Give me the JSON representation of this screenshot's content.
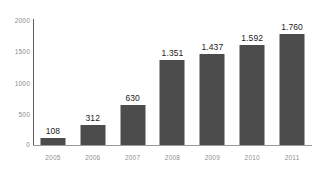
{
  "chart_data": {
    "type": "bar",
    "title": "",
    "subtitle": "",
    "xlabel": "",
    "ylabel": "",
    "categories": [
      "2005",
      "2006",
      "2007",
      "2008",
      "2009",
      "2010",
      "2011"
    ],
    "values": [
      108,
      312,
      630,
      1351,
      1437,
      1592,
      1760
    ],
    "value_labels": [
      "108",
      "312",
      "630",
      "1.351",
      "1.437",
      "1.592",
      "1.760"
    ],
    "ylim": [
      0,
      2000
    ],
    "y_ticks": [
      0,
      500,
      1000,
      1500,
      2000
    ],
    "y_tick_labels": [
      "0",
      "500",
      "1000",
      "1500",
      "2000"
    ],
    "grid": false,
    "legend": "none",
    "series": [
      {
        "name": "",
        "values": [
          108,
          312,
          630,
          1351,
          1437,
          1592,
          1760
        ]
      }
    ],
    "colors": {
      "bar": "#4c4c4c",
      "value_label": "#1c1c1c",
      "tick_label": "#8c8c8c",
      "category_label": "#8f8f8f",
      "y_axis_line": "#5c5c5c",
      "x_axis_line": "#9a9a9a",
      "background": "#ffffff"
    }
  }
}
